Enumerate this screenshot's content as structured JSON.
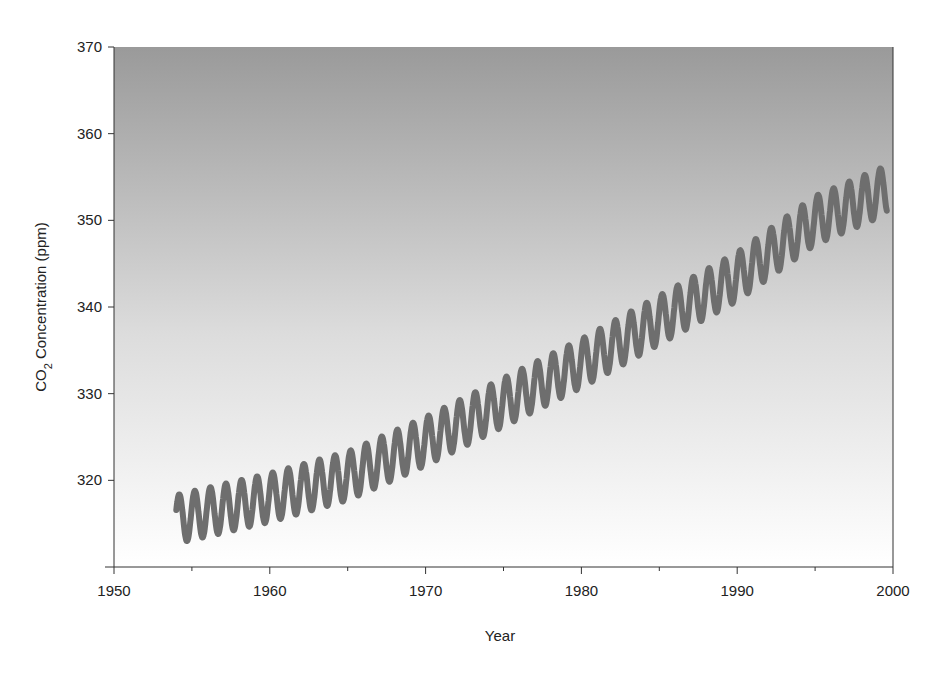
{
  "chart_data": {
    "type": "line",
    "title": "",
    "xlabel": "Year",
    "ylabel": "CO2 Concentration (ppm)",
    "xlim": [
      1950,
      2000
    ],
    "ylim": [
      310,
      370
    ],
    "xticks": [
      1950,
      1960,
      1970,
      1980,
      1990,
      2000
    ],
    "xminor_ticks": [
      1955,
      1965,
      1975,
      1985,
      1995
    ],
    "yticks": [
      320,
      330,
      340,
      350,
      360,
      370
    ],
    "grid": false,
    "legend": null,
    "series": [
      {
        "name": "CO2 concentration (seasonal cycle)",
        "color": "#6e6e6e",
        "start_year": 1954.0,
        "end_year": 1999.6,
        "trend": {
          "x": [
            1954,
            1960,
            1965,
            1970,
            1975,
            1980,
            1985,
            1990,
            1995,
            1999.6
          ],
          "y": [
            315.5,
            318.0,
            320.5,
            324.5,
            329.0,
            333.5,
            338.5,
            343.5,
            350.0,
            353.5
          ]
        },
        "seasonal_amplitude_ppm": 2.8,
        "cycle_length_years": 1.0
      }
    ],
    "background": {
      "type": "vertical-gradient",
      "top_color": "#9a9a9a",
      "bottom_color": "#ffffff"
    }
  }
}
